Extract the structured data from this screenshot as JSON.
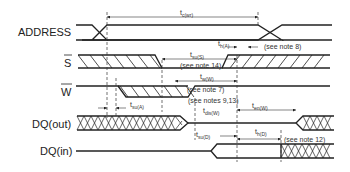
{
  "diagram": {
    "type": "timing-diagram",
    "signals": [
      {
        "id": "address",
        "label": "ADDRESS",
        "overbar": false
      },
      {
        "id": "s",
        "label": "S",
        "overbar": true
      },
      {
        "id": "w",
        "label": "W",
        "overbar": true
      },
      {
        "id": "dq_out",
        "label": "DQ(out)",
        "overbar": false
      },
      {
        "id": "dq_in",
        "label": "DQ(in)",
        "overbar": false
      }
    ],
    "timings": {
      "tcwr": {
        "main": "t",
        "sub": "c(wr)"
      },
      "thA": {
        "main": "t",
        "sub": "h(A)"
      },
      "tsuS": {
        "main": "t",
        "sub": "su(S)"
      },
      "twW": {
        "main": "t",
        "sub": "w(W)"
      },
      "tsuA": {
        "main": "t",
        "sub": "su(A)"
      },
      "tdisW": {
        "main": "t",
        "sub": "dis(W)"
      },
      "tenW": {
        "main": "t",
        "sub": "en(W)"
      },
      "tsuD": {
        "main": "t",
        "sub": "su(D)"
      },
      "thD": {
        "main": "t",
        "sub": "h(D)"
      }
    },
    "notes": {
      "note8": "(see note 8)",
      "note14": "(see note 14)",
      "note7": "(see note 7)",
      "note913": "(see notes 9,13)",
      "note12": "(see note 12)"
    }
  }
}
